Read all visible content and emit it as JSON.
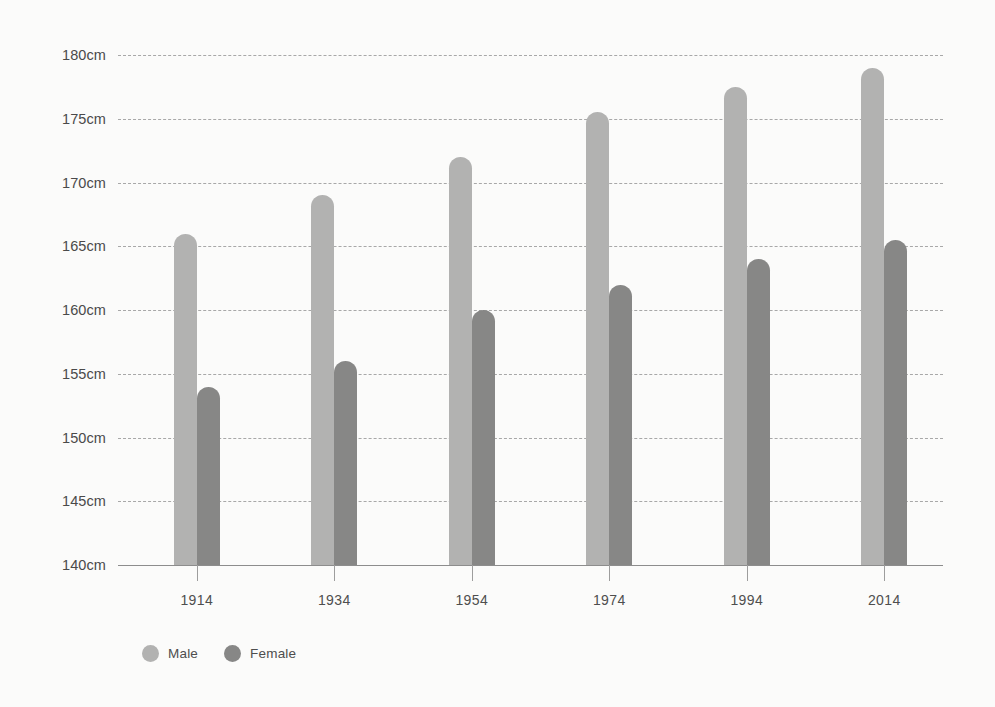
{
  "chart_data": {
    "type": "bar",
    "title": "",
    "subtitle": "",
    "xlabel": "",
    "ylabel": "",
    "categories": [
      "1914",
      "1934",
      "1954",
      "1974",
      "1994",
      "2014"
    ],
    "series": [
      {
        "name": "Male",
        "color": "#b2b2b1",
        "values": [
          166,
          169,
          172,
          175.5,
          177.5,
          179
        ]
      },
      {
        "name": "Female",
        "color": "#878786",
        "values": [
          154,
          156,
          160,
          162,
          164,
          165.5
        ]
      }
    ],
    "ylim": [
      140,
      180
    ],
    "ytick_step": 5,
    "ytick_values": [
      180,
      175,
      170,
      165,
      160,
      155,
      150,
      145,
      140
    ],
    "ytick_labels": [
      "180cm",
      "175cm",
      "170cm",
      "165cm",
      "160cm",
      "155cm",
      "150cm",
      "145cm",
      "140cm"
    ],
    "unit": "cm",
    "grid": true,
    "grid_style": "dashed-horizontal",
    "legend_position": "bottom-left",
    "legend_marker": "circle",
    "background_color": "#fbfbfa",
    "grid_color": "#9a9a9a",
    "axis_color": "#8d8d8d",
    "text_color": "#4a4a4a"
  },
  "legend": {
    "items": [
      {
        "label": "Male",
        "color": "#b2b2b1"
      },
      {
        "label": "Female",
        "color": "#878786"
      }
    ]
  }
}
